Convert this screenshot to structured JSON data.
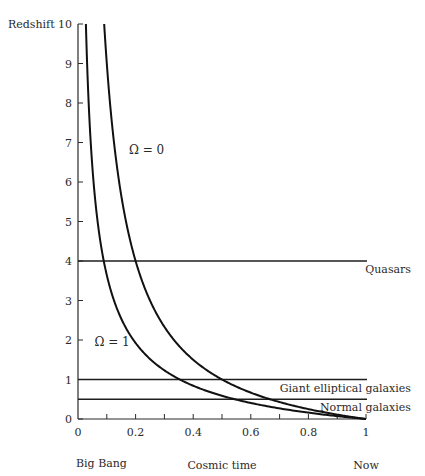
{
  "chart_data": {
    "type": "line",
    "title": "",
    "ylabel": "Redshift",
    "xlabel": "Cosmic time",
    "x_start_label": "Big Bang",
    "x_end_label": "Now",
    "xlim": [
      0,
      1
    ],
    "ylim": [
      0,
      10
    ],
    "x_ticks": [
      0,
      0.2,
      0.4,
      0.6,
      0.8,
      1
    ],
    "x_tick_labels": [
      "0",
      "0.2",
      "0.4",
      "0.6",
      "0.8",
      "1"
    ],
    "x_minor_ticks": [
      0.1,
      0.3,
      0.5,
      0.7,
      0.9
    ],
    "y_ticks": [
      0,
      1,
      2,
      3,
      4,
      5,
      6,
      7,
      8,
      9,
      10
    ],
    "y_tick_labels": [
      "0",
      "1",
      "2",
      "3",
      "4",
      "5",
      "6",
      "7",
      "8",
      "9",
      "10"
    ],
    "grid": false,
    "legend": "none",
    "series": [
      {
        "name": "Ω = 1",
        "relation": "t = (1+z)^(-3/2)",
        "points": [
          {
            "x": 0.027,
            "y": 10
          },
          {
            "x": 0.032,
            "y": 9
          },
          {
            "x": 0.037,
            "y": 8
          },
          {
            "x": 0.044,
            "y": 7
          },
          {
            "x": 0.054,
            "y": 6
          },
          {
            "x": 0.068,
            "y": 5
          },
          {
            "x": 0.089,
            "y": 4
          },
          {
            "x": 0.125,
            "y": 3
          },
          {
            "x": 0.192,
            "y": 2
          },
          {
            "x": 0.354,
            "y": 1
          },
          {
            "x": 0.544,
            "y": 0.5
          },
          {
            "x": 0.761,
            "y": 0.2
          },
          {
            "x": 1.0,
            "y": 0
          }
        ]
      },
      {
        "name": "Ω = 0",
        "relation": "t = 1/(1+z)",
        "points": [
          {
            "x": 0.091,
            "y": 10
          },
          {
            "x": 0.1,
            "y": 9
          },
          {
            "x": 0.111,
            "y": 8
          },
          {
            "x": 0.125,
            "y": 7
          },
          {
            "x": 0.143,
            "y": 6
          },
          {
            "x": 0.167,
            "y": 5
          },
          {
            "x": 0.2,
            "y": 4
          },
          {
            "x": 0.25,
            "y": 3
          },
          {
            "x": 0.333,
            "y": 2
          },
          {
            "x": 0.5,
            "y": 1
          },
          {
            "x": 0.667,
            "y": 0.5
          },
          {
            "x": 0.833,
            "y": 0.2
          },
          {
            "x": 1.0,
            "y": 0
          }
        ]
      }
    ],
    "horizontal_lines": [
      {
        "name": "Quasars",
        "y": 4
      },
      {
        "name": "Giant elliptical galaxies",
        "y": 1
      },
      {
        "name": "Normal galaxies",
        "y": 0.5
      }
    ],
    "annotations": [
      {
        "text": "Ω = 0",
        "x": 0.17,
        "y": 6.8
      },
      {
        "text": "Ω = 1",
        "x": 0.05,
        "y": 1.95
      }
    ]
  }
}
